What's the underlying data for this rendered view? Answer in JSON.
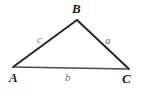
{
  "figure": {
    "kind": "triangle-diagram",
    "background_color": "#ffffff",
    "stroke_color": "#262626",
    "base_stroke_color": "#4a4a4a",
    "vertex_label_color": "#1b1b1b",
    "side_label_color": "#6f6f6f",
    "vertices": [
      {
        "name": "A",
        "label": "A",
        "x": 13,
        "y": 67
      },
      {
        "name": "B",
        "label": "B",
        "x": 77,
        "y": 20
      },
      {
        "name": "C",
        "label": "C",
        "x": 129,
        "y": 69
      }
    ],
    "sides": [
      {
        "name": "a",
        "label": "a",
        "from": "B",
        "to": "C"
      },
      {
        "name": "b",
        "label": "b",
        "from": "A",
        "to": "C"
      },
      {
        "name": "c",
        "label": "c",
        "from": "A",
        "to": "B"
      }
    ],
    "path": "M 13 67 L 77 20 L 129 69 Z",
    "base_path": "M 13 67 L 129 69"
  }
}
